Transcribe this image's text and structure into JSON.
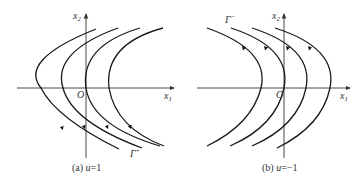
{
  "panels": [
    {
      "id": "a",
      "caption": "(a) u=1",
      "caption_prefix": "(a) ",
      "caption_var": "u",
      "caption_val": "=1",
      "axis_x_label": "x",
      "axis_x_sub": "1",
      "axis_y_label": "x",
      "axis_y_sub": "2",
      "origin_label": "O",
      "curve_label": "Γ",
      "curve_label_sup": "+",
      "curves_open": "right",
      "arrow_direction": "up (toward vertex, lower half)"
    },
    {
      "id": "b",
      "caption": "(b) u=−1",
      "caption_prefix": "(b) ",
      "caption_var": "u",
      "caption_val": "=−1",
      "axis_x_label": "x",
      "axis_x_sub": "1",
      "axis_y_label": "x",
      "axis_y_sub": "2",
      "origin_label": "O",
      "curve_label": "Γ",
      "curve_label_sup": "−",
      "curves_open": "left",
      "arrow_direction": "down (toward vertex, upper half)"
    }
  ]
}
